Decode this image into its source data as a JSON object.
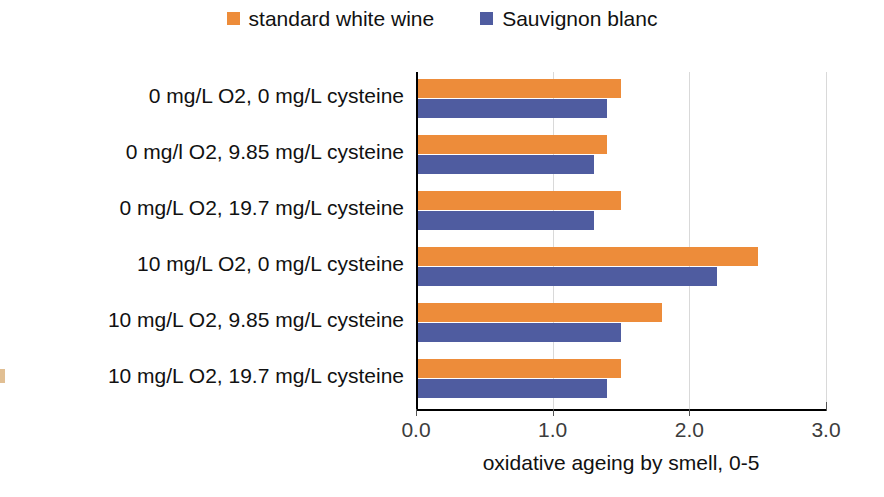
{
  "legend": {
    "position": "top-center",
    "items": [
      {
        "label": "standard white wine",
        "color": "#ED8C3A",
        "swatch_icon": "square-swatch-icon"
      },
      {
        "label": "Sauvignon blanc",
        "color": "#4F5CA0",
        "swatch_icon": "square-swatch-icon"
      }
    ]
  },
  "axis": {
    "x_title": "oxidative ageing by smell, 0-5",
    "x_ticks": [
      "0.0",
      "1.0",
      "2.0",
      "3.0"
    ],
    "x_min": 0.0,
    "x_max": 3.0
  },
  "categories": [
    "0 mg/L O2,  0 mg/L cysteine",
    "0 mg/l O2,  9.85 mg/L cysteine",
    "0 mg/L O2,  19.7 mg/L cysteine",
    "10 mg/L O2,  0 mg/L cysteine",
    "10  mg/L O2,  9.85 mg/L cysteine",
    "10 mg/L O2,  19.7 mg/L cysteine"
  ],
  "chart_data": {
    "type": "bar",
    "orientation": "horizontal",
    "title": "",
    "subtitle": "",
    "xlabel": "oxidative ageing by smell, 0-5",
    "ylabel": "",
    "xlim": [
      0.0,
      3.0
    ],
    "xticks": [
      0.0,
      1.0,
      2.0,
      3.0
    ],
    "grid": "vertical",
    "legend_position": "top-center",
    "categories": [
      "0 mg/L O2,  0 mg/L cysteine",
      "0 mg/l O2,  9.85 mg/L cysteine",
      "0 mg/L O2,  19.7 mg/L cysteine",
      "10 mg/L O2,  0 mg/L cysteine",
      "10  mg/L O2,  9.85 mg/L cysteine",
      "10 mg/L O2,  19.7 mg/L cysteine"
    ],
    "series": [
      {
        "name": "standard white wine",
        "color": "#ED8C3A",
        "values": [
          1.5,
          1.4,
          1.5,
          2.5,
          1.8,
          1.5
        ]
      },
      {
        "name": "Sauvignon blanc",
        "color": "#4F5CA0",
        "values": [
          1.4,
          1.3,
          1.3,
          2.2,
          1.5,
          1.4
        ]
      }
    ]
  }
}
